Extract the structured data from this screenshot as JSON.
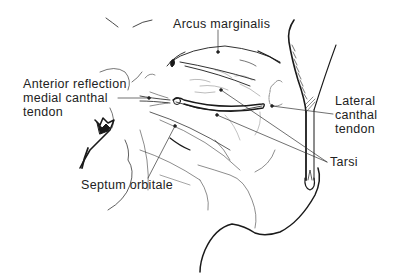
{
  "diagram": {
    "labels": {
      "arcus_marginalis": "Arcus marginalis",
      "anterior_reflection": [
        "Anterior reflection",
        "medial canthal",
        "tendon"
      ],
      "lateral_canthal": [
        "Lateral",
        "canthal",
        "tendon"
      ],
      "tarsi": "Tarsi",
      "septum_orbitale": "Septum orbitale"
    },
    "colors": {
      "ink": "#1a1a1a",
      "leader": "#333333",
      "background": "#ffffff"
    }
  }
}
